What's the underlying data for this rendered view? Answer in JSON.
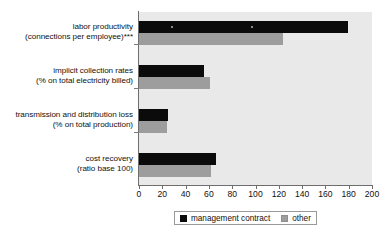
{
  "chart_data": {
    "type": "bar",
    "orientation": "horizontal",
    "title": "",
    "subtitle": "",
    "xlabel": "",
    "ylabel": "",
    "xlim": [
      0,
      200
    ],
    "xticks": [
      0,
      20,
      40,
      60,
      80,
      100,
      120,
      140,
      160,
      180,
      200
    ],
    "grid": false,
    "legend_position": "bottom",
    "categories": [
      "labor productivity (connections per employee)***",
      "implicit collection rates (% on total electricity billed)",
      "transmission and distribution loss (% on total production)",
      "cost recovery (ratio base 100)"
    ],
    "category_lines": [
      [
        "labor productivity",
        "(connections per employee)***"
      ],
      [
        "implicit collection rates",
        "(% on total electricity billed)"
      ],
      [
        "transmission and distribution loss",
        "(% on total production)"
      ],
      [
        "cost recovery",
        "(ratio base 100)"
      ]
    ],
    "series": [
      {
        "name": "management contract",
        "color": "#0b0b0b",
        "values": [
          179,
          56,
          25,
          66
        ]
      },
      {
        "name": "other",
        "color": "#9d9d9d",
        "values": [
          124,
          61,
          24,
          62
        ]
      }
    ]
  },
  "axis": {
    "tick_labels": [
      "0",
      "20",
      "40",
      "60",
      "80",
      "100",
      "120",
      "140",
      "160",
      "180",
      "200"
    ]
  },
  "legend": {
    "entries": [
      {
        "label": "management contract",
        "color": "#0b0b0b"
      },
      {
        "label": "other",
        "color": "#9d9d9d"
      }
    ]
  },
  "colors": {
    "series_management_contract": "#0b0b0b",
    "series_other": "#9d9d9d",
    "plot_background": "#e9e9e9",
    "axis": "#6e6e6e",
    "page_background": "#ffffff"
  }
}
